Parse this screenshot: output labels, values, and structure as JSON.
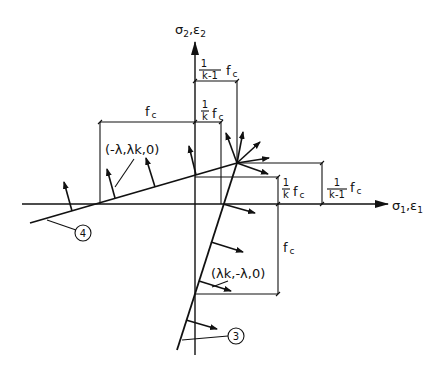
{
  "diagram": {
    "axes": {
      "vertical_label": "σ",
      "vertical_sub1": "2",
      "vertical_sep": ",ε",
      "vertical_sub2": "2",
      "horizontal_label": "σ",
      "horizontal_sub1": "1",
      "horizontal_sep": ",ε",
      "horizontal_sub2": "1"
    },
    "dimensions": {
      "top_fraction_num": "1",
      "top_fraction_den": "k-1",
      "top_fc": "f",
      "top_fc_sub": "c",
      "mid_fraction_num": "1",
      "mid_fraction_den": "k",
      "mid_fc": "f",
      "mid_fc_sub": "c",
      "left_fc": "f",
      "left_fc_sub": "c",
      "right_small_num": "1",
      "right_small_den": "k",
      "right_small_fc": "f",
      "right_small_fc_sub": "c",
      "right_big_num": "1",
      "right_big_den": "k-1",
      "right_big_fc": "f",
      "right_big_fc_sub": "c",
      "lower_fc": "f",
      "lower_fc_sub": "c"
    },
    "vectors": {
      "line4_normal": "(-λ,λk,0)",
      "line3_normal": "(λk,-λ,0)"
    },
    "markers": {
      "line4": "4",
      "line3": "3"
    }
  }
}
